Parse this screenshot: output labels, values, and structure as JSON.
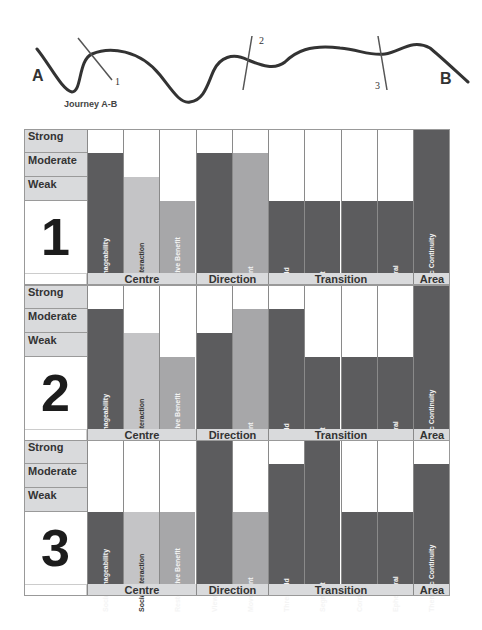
{
  "journey": {
    "title": "Journey A-B",
    "start_label": "A",
    "end_label": "B",
    "crossings": [
      {
        "label": "1"
      },
      {
        "label": "2"
      },
      {
        "label": "3"
      }
    ]
  },
  "levels": [
    "Strong",
    "Moderate",
    "Weak"
  ],
  "columns": [
    {
      "label": "Social Imageability",
      "group": "Centre"
    },
    {
      "label": "Social Interaction",
      "group": "Centre"
    },
    {
      "label": "Restorative Benefit",
      "group": "Centre"
    },
    {
      "label": "View",
      "group": "Direction"
    },
    {
      "label": "Movement",
      "group": "Direction"
    },
    {
      "label": "Threshold",
      "group": "Transition"
    },
    {
      "label": "Segment",
      "group": "Transition"
    },
    {
      "label": "Corridor",
      "group": "Transition"
    },
    {
      "label": "Ephemeral",
      "group": "Transition"
    },
    {
      "label": "Thematic Continuity",
      "group": "Area"
    }
  ],
  "groups": [
    {
      "label": "Centre",
      "span": 3
    },
    {
      "label": "Direction",
      "span": 2
    },
    {
      "label": "Transition",
      "span": 4
    },
    {
      "label": "Area",
      "span": 1
    }
  ],
  "colors": {
    "dark": "#5c5c5e",
    "mid": "#a7a7a9",
    "light": "#c4c4c6",
    "header": "#d9dadc"
  },
  "column_shades": [
    "dark",
    "light",
    "mid",
    "dark",
    "mid",
    "dark",
    "dark",
    "dark",
    "dark",
    "dark"
  ],
  "panels": [
    {
      "number": "1",
      "values": [
        2,
        1,
        0,
        2,
        2,
        0,
        0,
        0,
        0,
        3
      ],
      "bar_shades": [
        "dark",
        "light",
        "mid",
        "dark",
        "mid",
        "dark",
        "dark",
        "dark",
        "dark",
        "dark"
      ]
    },
    {
      "number": "2",
      "values": [
        2,
        1,
        0,
        1,
        2,
        2,
        0,
        0,
        0,
        3
      ],
      "bar_shades": [
        "dark",
        "light",
        "mid",
        "dark",
        "mid",
        "dark",
        "dark",
        "dark",
        "dark",
        "dark"
      ]
    },
    {
      "number": "3",
      "values": [
        0,
        0,
        0,
        3,
        0,
        2,
        3,
        0,
        0,
        2
      ],
      "bar_shades": [
        "dark",
        "light",
        "mid",
        "dark",
        "mid",
        "dark",
        "dark",
        "dark",
        "dark",
        "dark"
      ]
    }
  ],
  "chart_data": {
    "type": "bar",
    "title": "Journey A-B",
    "categories": [
      "Social Imageability",
      "Social Interaction",
      "Restorative Benefit",
      "View",
      "Movement",
      "Threshold",
      "Segment",
      "Corridor",
      "Ephemeral",
      "Thematic Continuity"
    ],
    "category_groups": {
      "Centre": [
        "Social Imageability",
        "Social Interaction",
        "Restorative Benefit"
      ],
      "Direction": [
        "View",
        "Movement"
      ],
      "Transition": [
        "Threshold",
        "Segment",
        "Corridor",
        "Ephemeral"
      ],
      "Area": [
        "Thematic Continuity"
      ]
    },
    "y_scale": {
      "0": "None",
      "1": "Weak",
      "2": "Moderate",
      "3": "Strong"
    },
    "ylim": [
      0,
      3
    ],
    "series": [
      {
        "name": "1",
        "values": [
          2,
          1,
          0,
          2,
          2,
          0,
          0,
          0,
          0,
          3
        ]
      },
      {
        "name": "2",
        "values": [
          2,
          1,
          0,
          1,
          2,
          2,
          0,
          0,
          0,
          3
        ]
      },
      {
        "name": "3",
        "values": [
          0,
          0,
          0,
          3,
          0,
          2,
          3,
          0,
          0,
          2
        ]
      }
    ],
    "grid": true,
    "legend": "none"
  }
}
